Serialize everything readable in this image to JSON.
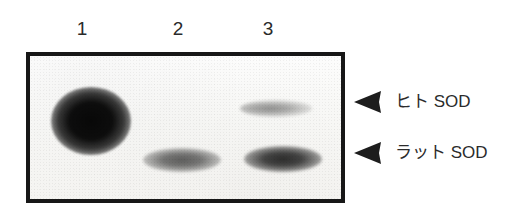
{
  "figure": {
    "type": "western-blot-autoradiograph",
    "lane_labels": [
      "1",
      "2",
      "3"
    ],
    "annotations": [
      {
        "icon": "left-triangle-arrow-icon",
        "label": "ヒト SOD"
      },
      {
        "icon": "left-triangle-arrow-icon",
        "label": "ラット SOD"
      }
    ],
    "colors": {
      "background": "#ffffff",
      "frame": "#171717",
      "blot_background": "#fbfbfa",
      "text": "#2b2b2b"
    },
    "bands": [
      {
        "lane": "1",
        "target": "ヒト SOD",
        "intensity": "very strong"
      },
      {
        "lane": "3",
        "target": "ヒト SOD",
        "intensity": "faint"
      },
      {
        "lane": "2",
        "target": "ラット SOD",
        "intensity": "moderate"
      },
      {
        "lane": "3",
        "target": "ラット SOD",
        "intensity": "strong"
      }
    ]
  }
}
